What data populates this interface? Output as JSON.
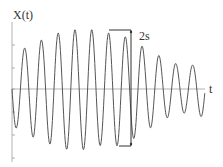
{
  "chart_data": {
    "type": "line",
    "title": "",
    "ylabel": "X(t)",
    "xlabel": "t",
    "grid": false,
    "legend": null,
    "annotation": {
      "label": "2s",
      "description": "Bracket spanning peak-to-trough at maximum amplitude (double amplitude 2s)"
    },
    "x_pixel_range": [
      12,
      205
    ],
    "zero_line_y": 89,
    "period_px": 16.8,
    "peaks": [
      {
        "x": 25,
        "y": 41
      },
      {
        "x": 42,
        "y": 49
      },
      {
        "x": 59,
        "y": 56
      },
      {
        "x": 76,
        "y": 59
      },
      {
        "x": 93,
        "y": 59
      },
      {
        "x": 110,
        "y": 56
      },
      {
        "x": 127,
        "y": 51
      },
      {
        "x": 144,
        "y": 41
      },
      {
        "x": 161,
        "y": 32
      },
      {
        "x": 177,
        "y": 25
      },
      {
        "x": 193,
        "y": 24
      }
    ],
    "troughs": [
      {
        "x": 17,
        "y": -39
      },
      {
        "x": 34,
        "y": -49
      },
      {
        "x": 51,
        "y": -56
      },
      {
        "x": 68,
        "y": -61
      },
      {
        "x": 85,
        "y": -61
      },
      {
        "x": 102,
        "y": -56
      },
      {
        "x": 119,
        "y": -57
      },
      {
        "x": 136,
        "y": -49
      },
      {
        "x": 153,
        "y": -38
      },
      {
        "x": 169,
        "y": -28
      },
      {
        "x": 186,
        "y": -24
      },
      {
        "x": 202,
        "y": -28
      }
    ],
    "y_ticks_px": [
      45,
      68,
      89,
      112,
      135,
      158
    ],
    "colors": {
      "curve": "#555555",
      "axis": "#999999",
      "bracket": "#333333"
    }
  },
  "labels": {
    "y_axis": "X(t)",
    "x_axis": "t",
    "bracket": "2s"
  }
}
